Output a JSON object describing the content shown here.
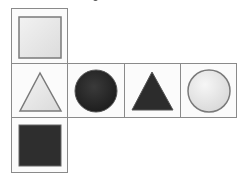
{
  "diagram": {
    "colors": {
      "border": "#8a8a8a",
      "light_fill": "#e6e6e6",
      "dark_fill": "#2e2e2e",
      "shape_stroke": "#7a7a7a"
    },
    "faces": [
      {
        "position": "top",
        "shape": "square",
        "fill": "light"
      },
      {
        "position": "middle-1",
        "shape": "triangle",
        "fill": "light"
      },
      {
        "position": "middle-2",
        "shape": "circle",
        "fill": "dark"
      },
      {
        "position": "middle-3",
        "shape": "triangle",
        "fill": "dark"
      },
      {
        "position": "middle-4",
        "shape": "circle",
        "fill": "light"
      },
      {
        "position": "bottom",
        "shape": "square",
        "fill": "dark"
      }
    ]
  }
}
